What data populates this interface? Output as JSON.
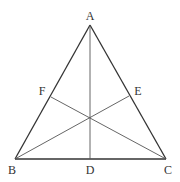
{
  "diagram": {
    "type": "equilateral triangle with medians",
    "vertices": {
      "A": {
        "label": "A",
        "x": 90,
        "y": 25,
        "label_x": 90,
        "label_y": 20
      },
      "B": {
        "label": "B",
        "x": 15,
        "y": 159,
        "label_x": 12,
        "label_y": 174
      },
      "C": {
        "label": "C",
        "x": 166,
        "y": 159,
        "label_x": 168,
        "label_y": 174
      }
    },
    "midpoints": {
      "D": {
        "label": "D",
        "x": 90,
        "y": 159,
        "label_x": 90,
        "label_y": 174,
        "on_side": "BC"
      },
      "E": {
        "label": "E",
        "x": 129,
        "y": 96,
        "label_x": 138,
        "label_y": 95,
        "on_side": "AC"
      },
      "F": {
        "label": "F",
        "x": 51,
        "y": 97,
        "label_x": 42,
        "label_y": 95,
        "on_side": "AB"
      }
    },
    "segments": [
      {
        "from": "A",
        "to": "B",
        "kind": "side"
      },
      {
        "from": "B",
        "to": "C",
        "kind": "side"
      },
      {
        "from": "C",
        "to": "A",
        "kind": "side"
      },
      {
        "from": "A",
        "to": "D",
        "kind": "median"
      },
      {
        "from": "B",
        "to": "E",
        "kind": "median"
      },
      {
        "from": "C",
        "to": "F",
        "kind": "median"
      }
    ],
    "centroid": {
      "x": 90,
      "y": 118
    },
    "colors": {
      "line": "#333333",
      "background": "#ffffff"
    }
  }
}
